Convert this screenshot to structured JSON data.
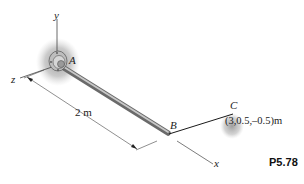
{
  "figure": {
    "problem_number": "P5.78",
    "axes": {
      "x": "x",
      "y": "y",
      "z": "z"
    },
    "points": {
      "A": "A",
      "B": "B",
      "C": "C"
    },
    "dimension_label": "2 m",
    "point_c_coordinates": "(3,0.5,–0.5)m",
    "colors": {
      "rod": "#8a8a8a",
      "rod_highlight": "#c4c4c4",
      "line": "#333333",
      "shadow": "#9a9a9a",
      "cable": "#1a1a1a"
    }
  }
}
